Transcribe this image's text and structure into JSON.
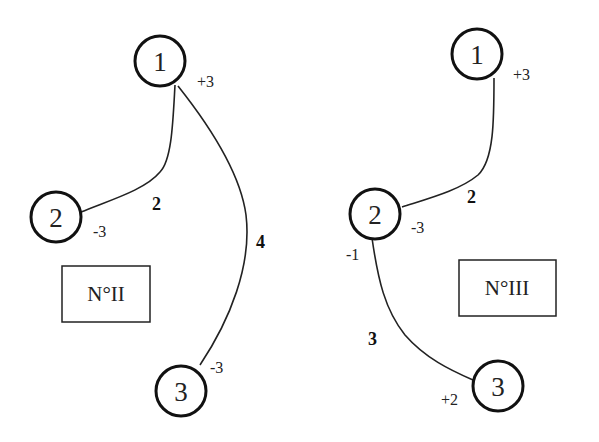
{
  "diagrams": [
    {
      "title": "N°II",
      "nodes": [
        {
          "id": "1",
          "label": "1",
          "charge": "+3"
        },
        {
          "id": "2",
          "label": "2",
          "charge": "-3"
        },
        {
          "id": "3",
          "label": "3",
          "charge": "-3"
        }
      ],
      "edges": [
        {
          "from": "1",
          "to": "2",
          "weight": "2"
        },
        {
          "from": "1",
          "to": "3",
          "weight": "4"
        }
      ]
    },
    {
      "title": "N°III",
      "nodes": [
        {
          "id": "1",
          "label": "1",
          "charge": "+3"
        },
        {
          "id": "2",
          "label": "2",
          "charge": "-3",
          "extra_charge": "-1"
        },
        {
          "id": "3",
          "label": "3",
          "charge": "+2"
        }
      ],
      "edges": [
        {
          "from": "1",
          "to": "2",
          "weight": "2"
        },
        {
          "from": "2",
          "to": "3",
          "weight": "3"
        }
      ]
    }
  ]
}
